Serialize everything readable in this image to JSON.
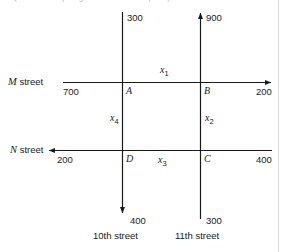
{
  "figure": {
    "caption_sliver": "(this is the top edge of the cut-off caption)",
    "horizontal_streets": [
      {
        "id": "m-street",
        "name_italic": "M",
        "name_rest": " street",
        "left_value": "700",
        "right_value": "200",
        "arrow_direction": "right"
      },
      {
        "id": "n-street",
        "name_italic": "N",
        "name_rest": " street",
        "left_value": "200",
        "right_value": "400",
        "arrow_direction": "left"
      }
    ],
    "vertical_streets": [
      {
        "id": "tenth-street",
        "name": "10th street",
        "top_value": "300",
        "bottom_value": "400",
        "arrow_direction": "down"
      },
      {
        "id": "eleventh-street",
        "name": "11th street",
        "top_value": "300",
        "bottom_value": "300",
        "arrow_direction": "up"
      }
    ],
    "eleventh_street_top_value": "900",
    "eleventh_street_bottom_value": "300",
    "nodes": [
      {
        "id": "node-a",
        "label": "A"
      },
      {
        "id": "node-b",
        "label": "B"
      },
      {
        "id": "node-c",
        "label": "C"
      },
      {
        "id": "node-d",
        "label": "D"
      }
    ],
    "flow_variables": [
      {
        "id": "x1",
        "symbol": "x",
        "index": "1",
        "edge": "A-B (M street, top)"
      },
      {
        "id": "x2",
        "symbol": "x",
        "index": "2",
        "edge": "B-C (11th street, right)"
      },
      {
        "id": "x3",
        "symbol": "x",
        "index": "3",
        "edge": "D-C (N street, bottom)"
      },
      {
        "id": "x4",
        "symbol": "x",
        "index": "4",
        "edge": "A-D (10th street, left)"
      }
    ],
    "colors": {
      "line": "#1a1a1a",
      "text": "#1a1a1a",
      "background": "#ffffff",
      "page_edge": "#d8d8d8"
    }
  }
}
